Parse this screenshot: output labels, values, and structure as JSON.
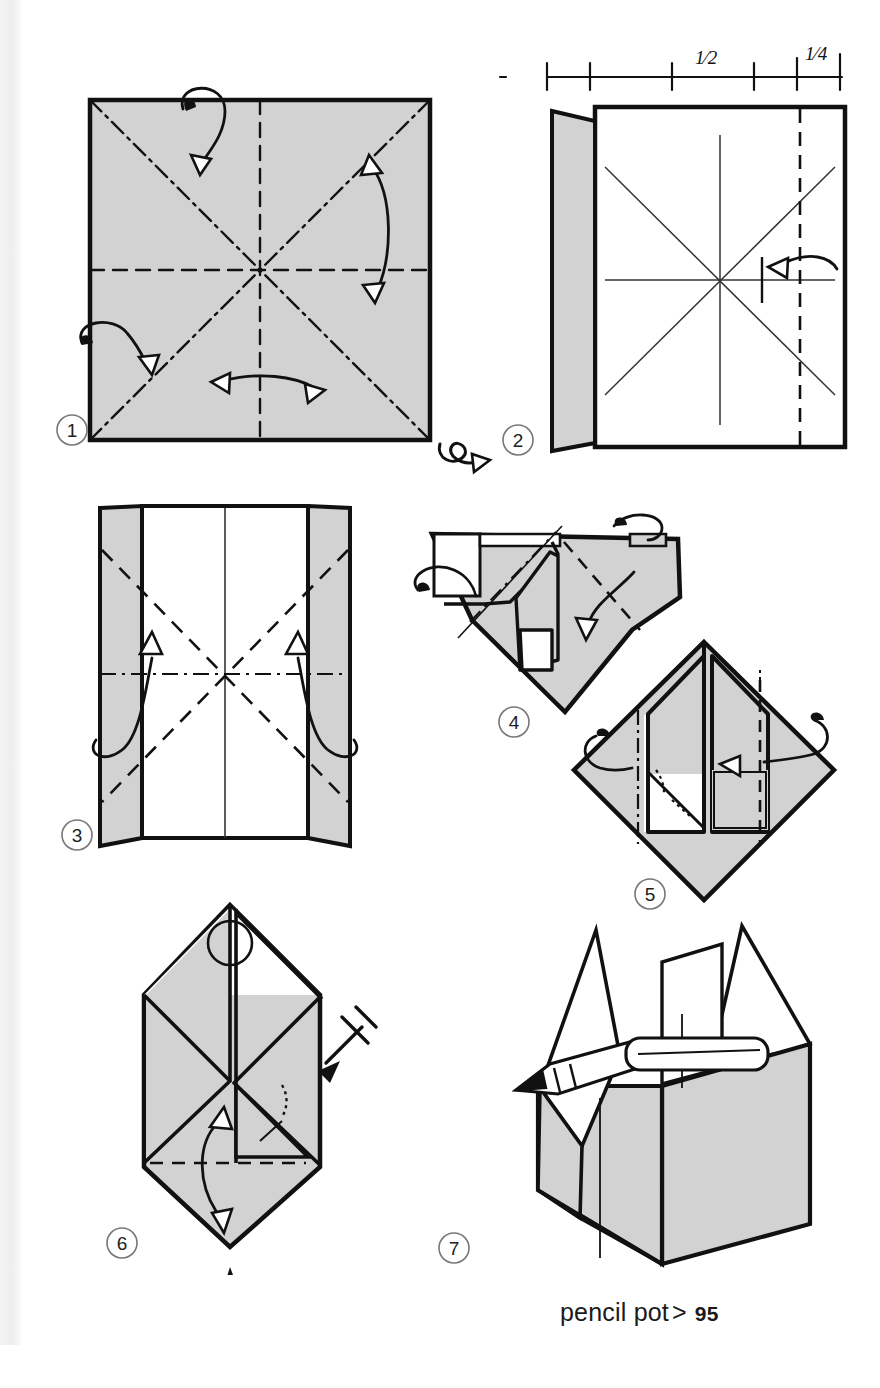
{
  "page": {
    "width": 880,
    "height": 1388,
    "background_color": "#ffffff",
    "gutter_color": "#eeeeef",
    "paper_gray": "#d2d2d2",
    "ink_color": "#111111",
    "type": "origami-instruction-diagram"
  },
  "caption": {
    "model_name": "pencil pot",
    "separator": ">",
    "page_number": "95"
  },
  "ruler": {
    "label_half": "1⁄2",
    "label_quarter": "1⁄4",
    "tick_count": 6
  },
  "steps": [
    {
      "number": "1",
      "label": "1",
      "description": "square of paper, colored side up, with diagonal mountain creases and horizontal/vertical valley creases; fold and unfold all four",
      "symbols": [
        "fold-unfold-arrow",
        "fold-unfold-arrow",
        "fold-unfold-arrow",
        "fold-unfold-arrow"
      ]
    },
    {
      "number": "2",
      "label": "2",
      "description": "turned over; left edge folded in to the quarter line, right edge about to be folded in along the dashed line",
      "symbols": [
        "turn-over-arrow",
        "valley-fold-arrow"
      ]
    },
    {
      "number": "3",
      "label": "3",
      "description": "both side edges folded in; diagonal valley creases with two curved arrows opening the flaps",
      "symbols": [
        "open-fold-arrow",
        "open-fold-arrow"
      ]
    },
    {
      "number": "4",
      "label": "4",
      "description": "collapsing the paper along the existing creases into a triangular form",
      "symbols": [
        "valley-fold-arrow",
        "repeat-arrow",
        "repeat-arrow"
      ]
    },
    {
      "number": "5",
      "label": "5",
      "description": "diamond form with two inner flaps; fold the outer points in to the center line, repeat behind",
      "symbols": [
        "valley-fold-arrow",
        "valley-fold-arrow"
      ]
    },
    {
      "number": "6",
      "label": "6",
      "description": "narrow hexagonal form; fold the lower flap up, repeat behind, then push in at the bottom point to open the pot",
      "symbols": [
        "magnifier-circle",
        "repeat-behind-arrow",
        "open-fold-arrow",
        "push-here-triangle"
      ]
    },
    {
      "number": "7",
      "label": "7",
      "description": "finished pencil pot, opened out into a three-dimensional box holding two pencils",
      "symbols": []
    }
  ]
}
